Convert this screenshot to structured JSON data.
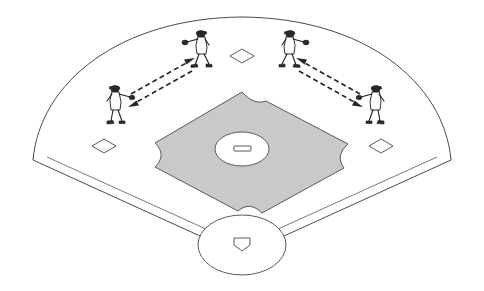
{
  "diagram": {
    "title": "Baseball Field Throwing Drill Diagram",
    "type": "sports-field-drill",
    "field": {
      "name": "baseball-field",
      "outfield_fence_label": "outfield-fence-arc",
      "foul_line_left_label": "left-foul-line",
      "foul_line_right_label": "right-foul-line",
      "infield_dirt_label": "infield-dirt",
      "infield_dirt_color": "#c9c9c9",
      "grass_color": "#ffffff",
      "line_color": "#4a4a4a"
    },
    "bases": [
      {
        "name": "first-base",
        "shape": "diamond",
        "cx": 381,
        "cy": 146
      },
      {
        "name": "second-base",
        "shape": "diamond",
        "cx": 242,
        "cy": 56
      },
      {
        "name": "third-base",
        "shape": "diamond",
        "cx": 104,
        "cy": 146
      },
      {
        "name": "home-plate",
        "shape": "pentagon",
        "cx": 242,
        "cy": 243
      }
    ],
    "mound": {
      "name": "pitchers-mound",
      "cx": 242,
      "cy": 149,
      "rx": 27,
      "ry": 17,
      "rubber_label": "pitching-rubber"
    },
    "home_circle": {
      "name": "home-plate-circle",
      "cx": 242,
      "cy": 245,
      "rx": 44,
      "ry": 30
    },
    "players": [
      {
        "id": "player-left-deep",
        "role": "thrower",
        "x": 200,
        "y": 46,
        "facing": "left"
      },
      {
        "id": "player-left-near",
        "role": "receiver",
        "x": 115,
        "y": 102,
        "facing": "right"
      },
      {
        "id": "player-right-deep",
        "role": "thrower",
        "x": 291,
        "y": 46,
        "facing": "right"
      },
      {
        "id": "player-right-near",
        "role": "receiver",
        "x": 376,
        "y": 102,
        "facing": "left"
      }
    ],
    "arrows": [
      {
        "id": "arrow-left-outbound",
        "from": "player-left-near",
        "to": "player-left-deep",
        "style": "dashed",
        "direction": "up-right"
      },
      {
        "id": "arrow-left-return",
        "from": "player-left-deep",
        "to": "player-left-near",
        "style": "dashed",
        "direction": "down-left"
      },
      {
        "id": "arrow-right-outbound",
        "from": "player-right-near",
        "to": "player-right-deep",
        "style": "dashed",
        "direction": "up-left"
      },
      {
        "id": "arrow-right-return",
        "from": "player-right-deep",
        "to": "player-right-near",
        "style": "dashed",
        "direction": "down-right"
      }
    ],
    "colors": {
      "dirt": "#c9c9c9",
      "outline": "#4a4a4a",
      "arrow": "#262626",
      "player_outline": "#1c1c1c",
      "background": "#ffffff"
    }
  }
}
